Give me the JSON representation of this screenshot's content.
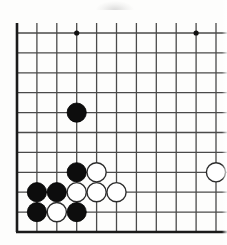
{
  "figure": {
    "kind": "go-board-diagram",
    "board": {
      "visible_columns": 11,
      "visible_rows": 10,
      "grid_spacing_px": 19.9,
      "origin_x_px": 17,
      "origin_y_px": 33,
      "line_color": "#4a4a4a",
      "border_color": "#1a1a1a",
      "background_color": "#fdfdfc",
      "border_edges": [
        "left",
        "bottom"
      ],
      "line_width_px": 1.3,
      "border_width_px": 2.6
    },
    "star_points": [
      {
        "label": "star-point-top-left",
        "col": 3,
        "row": 0
      },
      {
        "label": "star-point-top-right",
        "col": 9,
        "row": 0
      },
      {
        "color": "#111111",
        "radius_px": 2.6
      }
    ],
    "stones": [
      {
        "name": "black-stone-c3-r4",
        "color": "black",
        "col": 3,
        "row": 4
      },
      {
        "name": "black-stone-c3-r7",
        "color": "black",
        "col": 3,
        "row": 7
      },
      {
        "name": "white-stone-c4-r7",
        "color": "white",
        "col": 4,
        "row": 7
      },
      {
        "name": "white-stone-c10-r7",
        "color": "white",
        "col": 10,
        "row": 7
      },
      {
        "name": "black-stone-c1-r8",
        "color": "black",
        "col": 1,
        "row": 8
      },
      {
        "name": "black-stone-c2-r8",
        "color": "black",
        "col": 2,
        "row": 8
      },
      {
        "name": "white-stone-c3-r8",
        "color": "white",
        "col": 3,
        "row": 8
      },
      {
        "name": "white-stone-c4-r8",
        "color": "white",
        "col": 4,
        "row": 8
      },
      {
        "name": "white-stone-c5-r8",
        "color": "white",
        "col": 5,
        "row": 8
      },
      {
        "name": "black-stone-c1-r9",
        "color": "black",
        "col": 1,
        "row": 9
      },
      {
        "name": "white-stone-c2-r9",
        "color": "white",
        "col": 2,
        "row": 9
      },
      {
        "name": "black-stone-c3-r9",
        "color": "black",
        "col": 3,
        "row": 9
      }
    ],
    "stone_style": {
      "radius_px": 9.6,
      "black_fill": "#0d0d0d",
      "black_stroke": "#000000",
      "white_fill": "#ffffff",
      "white_stroke": "#2b2b2b",
      "white_stroke_width_px": 1.4
    },
    "counts": {
      "black_stones": 6,
      "white_stones": 6,
      "total_stones": 12
    }
  }
}
